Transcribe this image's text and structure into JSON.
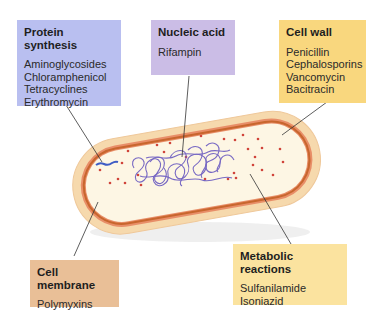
{
  "colors": {
    "protein_synthesis": "#b9bff0",
    "nucleic_acid": "#cbbde6",
    "cell_wall": "#f9d77e",
    "cell_membrane": "#e9bf97",
    "metabolic_reactions": "#fbe39f",
    "cell_wall_outer": "#f6d9ad",
    "membrane_stroke": "#c8662e",
    "cytoplasm": "#fdf6e4",
    "ribosome_dots": "#d0443a",
    "dna": "#6a5ac0"
  },
  "labels": {
    "protein_synthesis": {
      "title": "Protein synthesis",
      "drugs": [
        "Aminoglycosides",
        "Chloramphenicol",
        "Tetracyclines",
        "Erythromycin"
      ]
    },
    "nucleic_acid": {
      "title": "Nucleic acid",
      "drugs": [
        "Rifampin"
      ]
    },
    "cell_wall": {
      "title": "Cell wall",
      "drugs": [
        "Penicillin",
        "Cephalosporins",
        "Vancomycin",
        "Bacitracin"
      ]
    },
    "cell_membrane": {
      "title": "Cell membrane",
      "drugs": [
        "Polymyxins"
      ]
    },
    "metabolic_reactions": {
      "title": "Metabolic reactions",
      "drugs": [
        "Sulfanilamide",
        "Isoniazid"
      ]
    }
  }
}
